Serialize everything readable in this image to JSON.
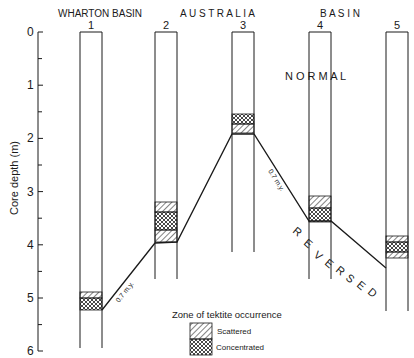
{
  "header": {
    "left_label": "WHARTON BASIN",
    "center_label": "A U S T R A L I A",
    "right_label": "B A S I N"
  },
  "axis": {
    "label": "Core depth (m)",
    "ticks": [
      "0",
      "1",
      "2",
      "3",
      "4",
      "5",
      "6"
    ],
    "range": [
      0,
      6
    ]
  },
  "cores": [
    {
      "id": "1",
      "bottom_depth_m": 5.95,
      "zones": [
        {
          "type": "scattered",
          "from": 4.9,
          "to": 5.0
        },
        {
          "type": "concentrated",
          "from": 5.0,
          "to": 5.2
        }
      ]
    },
    {
      "id": "2",
      "bottom_depth_m": 4.65,
      "zones": [
        {
          "type": "scattered",
          "from": 3.2,
          "to": 3.4
        },
        {
          "type": "concentrated",
          "from": 3.4,
          "to": 3.75
        },
        {
          "type": "scattered",
          "from": 3.75,
          "to": 3.95
        }
      ]
    },
    {
      "id": "3",
      "bottom_depth_m": 4.15,
      "zones": [
        {
          "type": "concentrated",
          "from": 1.55,
          "to": 1.7
        },
        {
          "type": "scattered",
          "from": 1.7,
          "to": 1.9
        }
      ]
    },
    {
      "id": "4",
      "bottom_depth_m": 4.65,
      "zones": [
        {
          "type": "scattered",
          "from": 3.1,
          "to": 3.3
        },
        {
          "type": "concentrated",
          "from": 3.3,
          "to": 3.55
        }
      ]
    },
    {
      "id": "5",
      "bottom_depth_m": 5.25,
      "zones": [
        {
          "type": "scattered",
          "from": 3.85,
          "to": 3.95
        },
        {
          "type": "concentrated",
          "from": 3.95,
          "to": 4.15
        },
        {
          "type": "scattered",
          "from": 4.15,
          "to": 4.25
        }
      ]
    }
  ],
  "annotations": {
    "normal": "N O R M A L",
    "reversed": [
      "R",
      "E",
      "V",
      "E",
      "R",
      "S",
      "E",
      "D"
    ],
    "age_label": "0.7 m.y."
  },
  "legend": {
    "title": "Zone of tektite occurrence",
    "items": [
      {
        "label": "Scattered",
        "pattern": "diagonal-hatch"
      },
      {
        "label": "Concentrated",
        "pattern": "cross-hatch"
      }
    ]
  }
}
